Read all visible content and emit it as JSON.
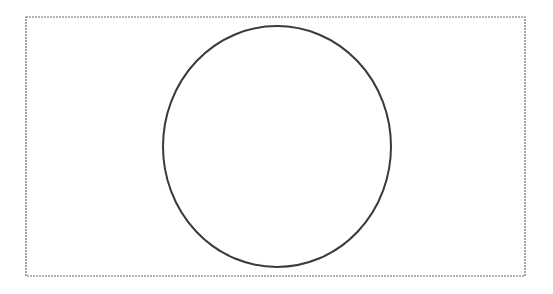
{
  "diagram": {
    "background": "#ffffff",
    "frame": {
      "shape": "rectangle",
      "x": 26,
      "y": 17,
      "width": 499,
      "height": 259,
      "stroke": "#6a6a6a",
      "stroke_style": "dashed-fine",
      "stroke_width": 1.2
    },
    "circle": {
      "shape": "ellipse",
      "cx": 277,
      "cy": 146.5,
      "rx": 114,
      "ry": 120.5,
      "stroke": "#3a3a3a",
      "stroke_width": 2,
      "fill": "none"
    }
  }
}
